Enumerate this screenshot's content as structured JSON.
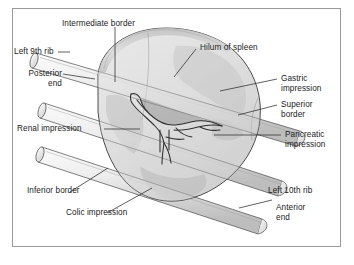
{
  "figure": {
    "frame": {
      "border_color": "#9a9a9a",
      "background": "#ffffff"
    },
    "palette": {
      "outline": "#3a3a3a",
      "leader_line": "#2b2b2b",
      "spleen_fill_light": "#d8d8d8",
      "spleen_fill_mid": "#c4c4c4",
      "spleen_fill_dark": "#a8a8a8",
      "rib_fill_light": "#f0f0f0",
      "rib_fill_mid": "#d9d9d9",
      "text": "#1b1b1b"
    },
    "labels": [
      {
        "id": "intermediate-border",
        "text": "Intermediate border",
        "align": "left"
      },
      {
        "id": "left-9th-rib",
        "text": "Left 9th rib",
        "align": "left"
      },
      {
        "id": "posterior-end",
        "text": "Posterior\nend",
        "align": "right"
      },
      {
        "id": "renal-impression",
        "text": "Renal impression",
        "align": "left"
      },
      {
        "id": "inferior-border",
        "text": "Inferior border",
        "align": "left"
      },
      {
        "id": "colic-impression",
        "text": "Colic impression",
        "align": "left"
      },
      {
        "id": "hilum-of-spleen",
        "text": "Hilum of spleen",
        "align": "left"
      },
      {
        "id": "gastric-impression",
        "text": "Gastric\nimpression",
        "align": "left"
      },
      {
        "id": "superior-border",
        "text": "Superior\nborder",
        "align": "left"
      },
      {
        "id": "pancreatic-impression",
        "text": "Pancreatic\nimpression",
        "align": "left"
      },
      {
        "id": "left-10th-rib",
        "text": "Left 10th rib",
        "align": "left"
      },
      {
        "id": "anterior-end",
        "text": "Anterior\nend",
        "align": "left"
      }
    ]
  }
}
